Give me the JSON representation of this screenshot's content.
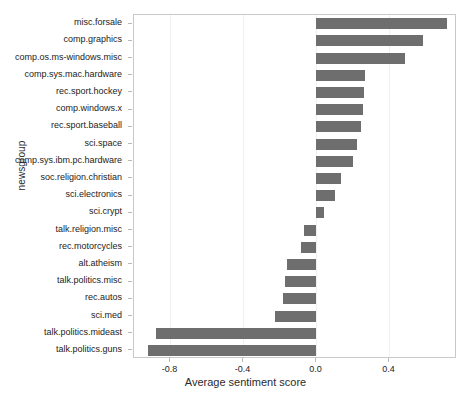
{
  "chart_data": {
    "type": "bar",
    "orientation": "horizontal",
    "title": "",
    "xlabel": "Average sentiment score",
    "ylabel": "newsgroup",
    "xlim": [
      -1.0,
      0.77
    ],
    "ylim": [
      -0.5,
      19.5
    ],
    "grid": false,
    "legend": null,
    "bar_color": "#6e6e6e",
    "xticks": [
      -0.8,
      -0.4,
      0.0,
      0.4
    ],
    "xticklabels": [
      "-0.8",
      "-0.4",
      "0.0",
      "0.4"
    ],
    "categories": [
      "misc.forsale",
      "comp.graphics",
      "comp.os.ms-windows.misc",
      "comp.sys.mac.hardware",
      "rec.sport.hockey",
      "comp.windows.x",
      "rec.sport.baseball",
      "sci.space",
      "comp.sys.ibm.pc.hardware",
      "soc.religion.christian",
      "sci.electronics",
      "sci.crypt",
      "talk.religion.misc",
      "rec.motorcycles",
      "alt.atheism",
      "talk.politics.misc",
      "rec.autos",
      "sci.med",
      "talk.politics.mideast",
      "talk.politics.guns"
    ],
    "values": [
      0.715,
      0.585,
      0.485,
      0.268,
      0.263,
      0.253,
      0.242,
      0.221,
      0.2,
      0.137,
      0.1,
      0.042,
      -0.068,
      -0.084,
      -0.163,
      -0.173,
      -0.184,
      -0.226,
      -0.879,
      -0.926
    ]
  }
}
